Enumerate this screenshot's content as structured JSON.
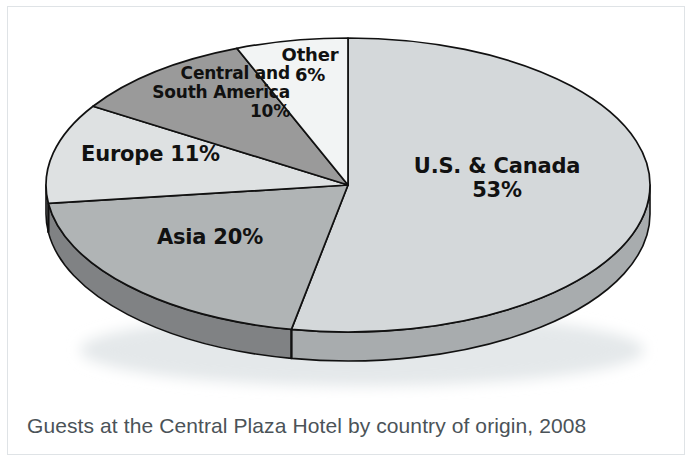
{
  "caption": "Guests at the Central Plaza Hotel by country of origin, 2008",
  "labels": {
    "us": "U.S. & Canada\n53%",
    "asia": "Asia 20%",
    "europe": "Europe 11%",
    "csa": "Central and\nSouth America\n10%",
    "other": "Other\n6%"
  },
  "chart_data": {
    "type": "pie",
    "title": "Guests at the Central Plaza Hotel by country of origin, 2008",
    "subtitle": "",
    "xlabel": "",
    "ylabel": "",
    "units": "percent",
    "legend_position": "none",
    "grid": false,
    "three_d": true,
    "start_angle_deg": 0,
    "direction": "clockwise",
    "categories": [
      "U.S. & Canada",
      "Asia",
      "Europe",
      "Central and South America",
      "Other"
    ],
    "values": [
      53,
      20,
      11,
      10,
      6
    ],
    "value_labels": [
      "53%",
      "20%",
      "11%",
      "10%",
      "6%"
    ],
    "total": 100,
    "colors": [
      "#d4d8da",
      "#b0b4b5",
      "#dee1e2",
      "#9a9a9a",
      "#f2f4f4"
    ],
    "side_colors": [
      "#a8acae",
      "#808284",
      "#b4b8ba",
      "#767879",
      "#c2c6c8"
    ],
    "outline_color": "#111111",
    "slices": [
      {
        "label": "U.S. & Canada",
        "value": 53,
        "value_label": "53%",
        "color": "#d4d8da",
        "start_deg": 0,
        "end_deg": 190.8
      },
      {
        "label": "Asia",
        "value": 20,
        "value_label": "20%",
        "color": "#b0b4b5",
        "start_deg": 190.8,
        "end_deg": 262.8
      },
      {
        "label": "Europe",
        "value": 11,
        "value_label": "11%",
        "color": "#dee1e2",
        "start_deg": 262.8,
        "end_deg": 302.4
      },
      {
        "label": "Central and South America",
        "value": 10,
        "value_label": "10%",
        "color": "#9a9a9a",
        "start_deg": 302.4,
        "end_deg": 338.4
      },
      {
        "label": "Other",
        "value": 6,
        "value_label": "6%",
        "color": "#f2f4f4",
        "start_deg": 338.4,
        "end_deg": 360
      }
    ]
  }
}
